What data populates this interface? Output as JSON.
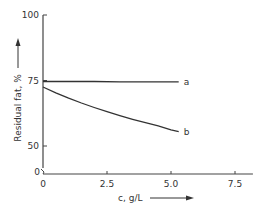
{
  "chart_data": {
    "type": "line",
    "title": "",
    "xlabel": "c, g/L",
    "ylabel": "Residual fat, %",
    "xlim": [
      0,
      8.2
    ],
    "ylim": [
      40,
      100
    ],
    "y_axis_break": true,
    "y_break_label": "0",
    "x_ticks": [
      0,
      2.5,
      5.0,
      7.5
    ],
    "x_tick_labels": [
      "0",
      "2.5",
      "5.0",
      "7.5"
    ],
    "y_ticks": [
      50,
      75,
      100
    ],
    "y_tick_labels": [
      "50",
      "75",
      "100"
    ],
    "grid": false,
    "legend": "none",
    "series": [
      {
        "name": "a",
        "x": [
          0,
          1,
          2,
          3,
          4,
          5,
          5.3
        ],
        "values": [
          74.6,
          74.6,
          74.6,
          74.5,
          74.5,
          74.5,
          74.5
        ]
      },
      {
        "name": "b",
        "x": [
          0,
          0.5,
          1,
          1.5,
          2,
          2.5,
          3,
          3.5,
          4,
          4.5,
          5,
          5.3
        ],
        "values": [
          72.5,
          70.3,
          68.3,
          66.4,
          64.7,
          63.1,
          61.6,
          60.2,
          58.9,
          57.7,
          56.2,
          55.5
        ]
      }
    ],
    "annotations": [
      "a",
      "b"
    ]
  },
  "labels": {
    "xlabel": "c, g/L",
    "ylabel": "Residual fat, %",
    "y_break": "0",
    "curve_a": "a",
    "curve_b": "b"
  }
}
